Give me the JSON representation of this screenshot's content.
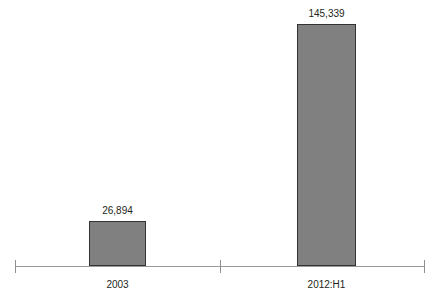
{
  "chart_data": {
    "type": "bar",
    "title": "",
    "subtitle": "",
    "xlabel": "",
    "ylabel": "",
    "categories": [
      "2003",
      "2012:H1"
    ],
    "values": [
      26894,
      145339
    ],
    "value_labels": [
      "26,894",
      "145,339"
    ],
    "ylim": [
      0,
      145339
    ],
    "grid": false,
    "legend": null,
    "legend_position": "none",
    "axis": {
      "x_axis_visible": true,
      "y_axis_visible": false,
      "tick_count": 3,
      "tick_labels": [
        "",
        "",
        ""
      ]
    },
    "series": [
      {
        "name": "",
        "values": [
          26894,
          145339
        ]
      }
    ],
    "annotations": []
  },
  "style": {
    "bar_fill": "#808080",
    "bar_border": "#333333",
    "axis_color": "#9a9a9a",
    "tick_color": "#8f8f8f",
    "text_color": "#231f20",
    "background": "#ffffff"
  }
}
